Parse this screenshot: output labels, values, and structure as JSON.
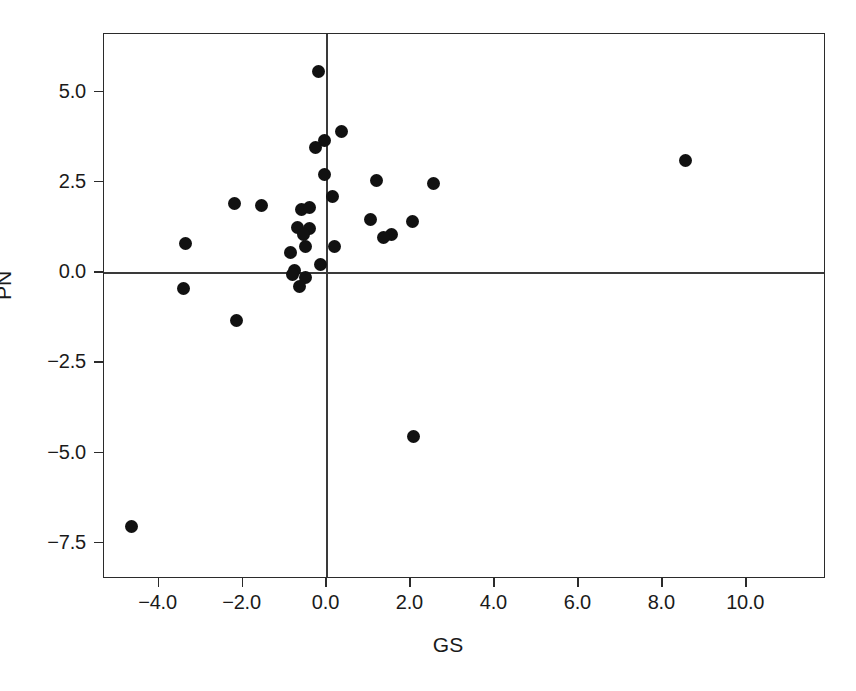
{
  "chart_data": {
    "type": "scatter",
    "title": "",
    "xlabel": "GS",
    "ylabel": "PN",
    "xlim": [
      -5.3,
      11.9
    ],
    "ylim": [
      -8.5,
      6.6
    ],
    "grid": false,
    "legend": null,
    "marker": {
      "shape": "circle",
      "color": "#111111",
      "size_px": 13
    },
    "reference_lines": [
      {
        "axis": "x",
        "value": 0.0,
        "color": "#3a3a3a"
      },
      {
        "axis": "y",
        "value": 0.0,
        "color": "#3a3a3a"
      }
    ],
    "xticks": [
      -4.0,
      -2.0,
      0.0,
      2.0,
      4.0,
      6.0,
      8.0,
      10.0
    ],
    "xticklabels": [
      "-4.0",
      "-2.0",
      "0.0",
      "2.0",
      "4.0",
      "6.0",
      "8.0",
      "10.0"
    ],
    "yticks": [
      5.0,
      2.5,
      0.0,
      -2.5,
      -5.0,
      -7.5
    ],
    "yticklabels": [
      "5.0",
      "2.5",
      "0.0",
      "-2.5",
      "-5.0",
      "-7.5"
    ],
    "points": [
      {
        "x": -0.2,
        "y": 5.55
      },
      {
        "x": 0.35,
        "y": 3.9
      },
      {
        "x": -0.05,
        "y": 3.65
      },
      {
        "x": -0.25,
        "y": 3.45
      },
      {
        "x": 8.55,
        "y": 3.1
      },
      {
        "x": -0.05,
        "y": 2.7
      },
      {
        "x": 1.2,
        "y": 2.55
      },
      {
        "x": 2.55,
        "y": 2.45
      },
      {
        "x": 0.15,
        "y": 2.1
      },
      {
        "x": -2.2,
        "y": 1.9
      },
      {
        "x": -1.55,
        "y": 1.85
      },
      {
        "x": -0.6,
        "y": 1.75
      },
      {
        "x": -0.4,
        "y": 1.8
      },
      {
        "x": 1.05,
        "y": 1.45
      },
      {
        "x": 2.05,
        "y": 1.4
      },
      {
        "x": -0.7,
        "y": 1.25
      },
      {
        "x": -0.4,
        "y": 1.2
      },
      {
        "x": -0.55,
        "y": 1.05
      },
      {
        "x": 1.55,
        "y": 1.05
      },
      {
        "x": 1.35,
        "y": 0.95
      },
      {
        "x": -3.35,
        "y": 0.8
      },
      {
        "x": -0.5,
        "y": 0.7
      },
      {
        "x": 0.2,
        "y": 0.7
      },
      {
        "x": -0.85,
        "y": 0.55
      },
      {
        "x": -0.15,
        "y": 0.2
      },
      {
        "x": -0.75,
        "y": 0.05
      },
      {
        "x": -0.8,
        "y": -0.05
      },
      {
        "x": -0.5,
        "y": -0.15
      },
      {
        "x": -0.65,
        "y": -0.4
      },
      {
        "x": -3.4,
        "y": -0.45
      },
      {
        "x": -2.15,
        "y": -1.35
      },
      {
        "x": 2.07,
        "y": -4.55
      },
      {
        "x": -4.65,
        "y": -7.05
      }
    ]
  }
}
